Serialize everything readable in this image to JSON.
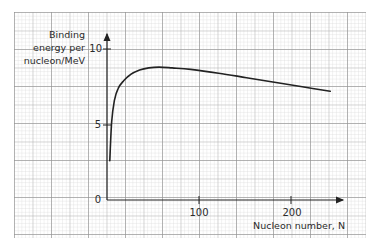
{
  "chart_data": {
    "type": "line",
    "title": "",
    "ylabel_lines": [
      "Binding",
      "energy per",
      "nucleon/MeV"
    ],
    "xlabel": "Nucleon number, N",
    "ylabel": "Binding energy per nucleon/MeV",
    "x_ticks": [
      {
        "value": 100,
        "label": "100"
      },
      {
        "value": 200,
        "label": "200"
      }
    ],
    "y_ticks": [
      {
        "value": 0,
        "label": "0"
      },
      {
        "value": 5,
        "label": "5"
      },
      {
        "value": 10,
        "label": "10"
      }
    ],
    "xlim": [
      0,
      240
    ],
    "ylim": [
      0,
      10.5
    ],
    "grid": true,
    "legend": null,
    "series": [
      {
        "name": "Binding energy per nucleon",
        "color": "#222222",
        "x": [
          3,
          5,
          8,
          12,
          18,
          25,
          35,
          45,
          56,
          70,
          90,
          120,
          150,
          180,
          210,
          240
        ],
        "y": [
          2.6,
          5.2,
          6.6,
          7.4,
          7.9,
          8.3,
          8.6,
          8.75,
          8.8,
          8.75,
          8.65,
          8.4,
          8.1,
          7.8,
          7.5,
          7.2
        ]
      }
    ]
  },
  "axes": {
    "origin_label": "0",
    "y_label_5": "5",
    "y_label_10": "10",
    "x_label_100": "100",
    "x_label_200": "200",
    "x_title": "Nucleon number, N",
    "y_title_1": "Binding",
    "y_title_2": "energy per",
    "y_title_3": "nucleon/MeV"
  },
  "colors": {
    "grid_minor": "#d4d4d4",
    "grid_major": "#9a9a9a",
    "axis": "#222222",
    "curve": "#222222"
  }
}
